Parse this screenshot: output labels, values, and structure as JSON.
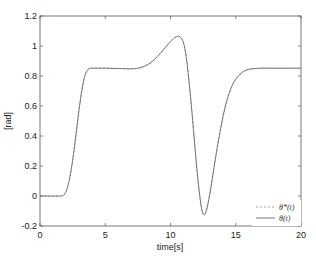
{
  "chart_data": {
    "type": "line",
    "title": "",
    "xlabel": "time[s]",
    "ylabel": "[rad]",
    "xlim": [
      0,
      20
    ],
    "ylim": [
      -0.2,
      1.2
    ],
    "xticks": [
      0,
      5,
      10,
      15,
      20
    ],
    "yticks": [
      -0.2,
      0,
      0.2,
      0.4,
      0.6,
      0.8,
      1,
      1.2
    ],
    "ytick_labels": [
      "-0.2",
      "0",
      "0.2",
      "0.4",
      "0.6",
      "0.8",
      "1",
      "1.2"
    ],
    "xtick_labels": [
      "0",
      "5",
      "10",
      "15",
      "20"
    ],
    "grid": false,
    "legend_position": "lower right",
    "series": [
      {
        "name": "θ*(t)",
        "style": "dashed",
        "color": "#888888",
        "x": [
          0,
          1.5,
          1.8,
          2.0,
          2.2,
          2.4,
          2.6,
          2.8,
          3.0,
          3.2,
          3.4,
          3.6,
          3.8,
          4.0,
          5.0,
          6.0,
          7.0,
          7.5,
          8.0,
          8.5,
          9.0,
          9.5,
          10.0,
          10.3,
          10.6,
          10.8,
          11.0,
          11.2,
          11.4,
          11.6,
          11.8,
          12.0,
          12.2,
          12.4,
          12.55,
          12.7,
          12.9,
          13.1,
          13.3,
          13.5,
          13.8,
          14.1,
          14.4,
          14.8,
          15.2,
          15.6,
          16.0,
          16.5,
          17.0,
          18.0,
          19.0,
          20.0
        ],
        "y": [
          0,
          0,
          0.005,
          0.03,
          0.09,
          0.18,
          0.3,
          0.44,
          0.58,
          0.7,
          0.79,
          0.835,
          0.85,
          0.852,
          0.852,
          0.85,
          0.848,
          0.852,
          0.865,
          0.89,
          0.93,
          0.98,
          1.03,
          1.055,
          1.065,
          1.055,
          1.02,
          0.93,
          0.78,
          0.6,
          0.4,
          0.2,
          0.03,
          -0.09,
          -0.125,
          -0.11,
          -0.04,
          0.06,
          0.17,
          0.28,
          0.43,
          0.56,
          0.66,
          0.75,
          0.8,
          0.83,
          0.845,
          0.85,
          0.852,
          0.852,
          0.852,
          0.852
        ]
      },
      {
        "name": "θ(t)",
        "style": "solid",
        "color": "#6a6a6a",
        "x": [
          0,
          1.5,
          1.8,
          2.0,
          2.2,
          2.4,
          2.6,
          2.8,
          3.0,
          3.2,
          3.4,
          3.6,
          3.8,
          4.0,
          5.0,
          6.0,
          7.0,
          7.5,
          8.0,
          8.5,
          9.0,
          9.5,
          10.0,
          10.3,
          10.6,
          10.8,
          11.0,
          11.2,
          11.4,
          11.6,
          11.8,
          12.0,
          12.2,
          12.4,
          12.55,
          12.7,
          12.9,
          13.1,
          13.3,
          13.5,
          13.8,
          14.1,
          14.4,
          14.8,
          15.2,
          15.6,
          16.0,
          16.5,
          17.0,
          18.0,
          19.0,
          20.0
        ],
        "y": [
          0,
          0,
          0.005,
          0.03,
          0.09,
          0.18,
          0.3,
          0.44,
          0.58,
          0.7,
          0.79,
          0.835,
          0.85,
          0.852,
          0.852,
          0.85,
          0.848,
          0.852,
          0.865,
          0.89,
          0.93,
          0.98,
          1.03,
          1.055,
          1.065,
          1.055,
          1.02,
          0.93,
          0.78,
          0.6,
          0.4,
          0.2,
          0.03,
          -0.09,
          -0.125,
          -0.11,
          -0.04,
          0.06,
          0.17,
          0.28,
          0.43,
          0.56,
          0.66,
          0.75,
          0.8,
          0.83,
          0.845,
          0.85,
          0.852,
          0.852,
          0.852,
          0.852
        ]
      }
    ]
  },
  "legend": {
    "items": [
      {
        "label": "θ*(t)",
        "style": "dashed"
      },
      {
        "label": "θ(t)",
        "style": "solid"
      }
    ]
  },
  "colors": {
    "axis": "#555555",
    "line": "#6a6a6a",
    "background": "#ffffff"
  }
}
